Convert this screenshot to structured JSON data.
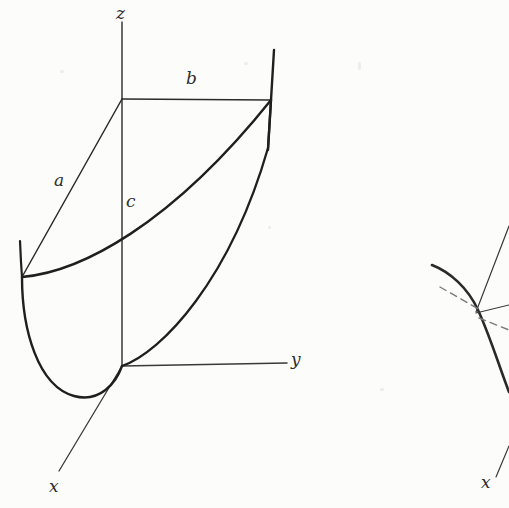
{
  "page": {
    "background_color": "#fcfcfb",
    "ink_color": "#2b2b2b",
    "width": 509,
    "height": 508
  },
  "figure_main": {
    "name": "paraboloid-coordinate-figure",
    "axes": [
      {
        "id": "z",
        "label": "z",
        "label_x": 116,
        "label_y": 5,
        "from": [
          122,
          22
        ],
        "to": [
          122,
          366
        ]
      },
      {
        "id": "y",
        "label": "y",
        "label_x": 291,
        "label_y": 351,
        "from": [
          122,
          366
        ],
        "to": [
          287,
          363
        ]
      },
      {
        "id": "x",
        "label": "x",
        "label_x": 49,
        "label_y": 478,
        "from": [
          122,
          366
        ],
        "to": [
          59,
          471
        ]
      }
    ],
    "dimension_labels": [
      {
        "id": "a",
        "label": "a",
        "x": 54,
        "y": 172
      },
      {
        "id": "b",
        "label": "b",
        "x": 186,
        "y": 70
      },
      {
        "id": "c",
        "label": "c",
        "x": 126,
        "y": 193
      }
    ],
    "vertices": {
      "origin": [
        122,
        366
      ],
      "z_top_corner": [
        122,
        99
      ],
      "right_top_corner": [
        271,
        100
      ],
      "left_corner": [
        22,
        277
      ],
      "right_rim_top": [
        274,
        50
      ],
      "left_rim_top": [
        20,
        241
      ],
      "parabola_bottom": [
        74,
        396
      ]
    },
    "edges": [
      {
        "id": "b-edge",
        "kind": "straight",
        "from": [
          122,
          99
        ],
        "to": [
          271,
          100
        ]
      },
      {
        "id": "a-edge",
        "kind": "straight",
        "from": [
          122,
          99
        ],
        "to": [
          22,
          277
        ]
      },
      {
        "id": "c-edge",
        "kind": "straight",
        "from": [
          122,
          99
        ],
        "to": [
          122,
          366
        ]
      }
    ],
    "curves": [
      {
        "id": "upper-rim-parabola",
        "desc": "upper parabolic rim from left corner to right top corner"
      },
      {
        "id": "lower-parabola",
        "desc": "lower parabolic rim through origin down around to left corner"
      },
      {
        "id": "right-generator",
        "desc": "right vertical generator line of the parabolic cylinder"
      },
      {
        "id": "left-generator",
        "desc": "short left vertical generator line of the parabolic cylinder"
      },
      {
        "id": "side-parabola",
        "desc": "parabola from origin rising to right top corner"
      }
    ]
  },
  "figure_secondary": {
    "name": "partial-figure-right-edge",
    "axis_label": {
      "id": "x-prime",
      "label": "x",
      "x": 481,
      "y": 474
    },
    "elements": [
      {
        "id": "thick-arc",
        "desc": "thick curved arc clipped by right page edge"
      },
      {
        "id": "thin-line-upper",
        "desc": "thin straight line descending from upper right"
      },
      {
        "id": "thin-line-right",
        "desc": "thin straight line heading right from node"
      },
      {
        "id": "dashed-line-a",
        "desc": "dashed construction line crossing the arc"
      },
      {
        "id": "dashed-line-b",
        "desc": "dashed construction line below node"
      },
      {
        "id": "x-axis-stub",
        "desc": "short straight axis stub with x label at bottom"
      }
    ]
  }
}
